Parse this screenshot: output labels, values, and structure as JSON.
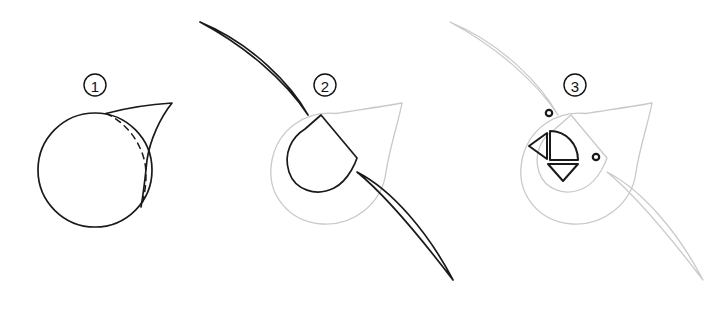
{
  "document": {
    "title": "Three-step shape construction tutorial",
    "width": 706,
    "height": 314,
    "background_color": "#ffffff",
    "kind": "line-art drawing instructions"
  },
  "palette": {
    "ink": "#1a1a1a",
    "guide_gray": "#c9c9c9",
    "background": "#ffffff",
    "label_ink": "#111111"
  },
  "stroke_widths": {
    "ink": 1.7,
    "guide": 1.3,
    "dashed": 1.5,
    "label_ring": 1.4
  },
  "steps": [
    {
      "id": "step-1",
      "number": "1",
      "label_position": {
        "x": 95,
        "y": 85
      },
      "label_radius": 11,
      "description": "Draw a circle, then add a pointed tail sweeping up to the right; a dashed arc marks the hidden part of the circle.",
      "elements": [
        {
          "name": "base-circle",
          "type": "circle",
          "center_x": 95,
          "center_y": 170,
          "radius": 57,
          "style": "ink"
        },
        {
          "name": "tail-point",
          "type": "point",
          "x": 172,
          "y": 103
        },
        {
          "name": "hidden-arc",
          "type": "dashed-arc",
          "style": "dashed"
        }
      ]
    },
    {
      "id": "step-2",
      "number": "2",
      "label_position": {
        "x": 325,
        "y": 85
      },
      "label_radius": 11,
      "description": "Keep the teardrop as a light guide, then add two long tapered wings and an inner rotated teardrop.",
      "elements": [
        {
          "name": "guide-teardrop",
          "type": "teardrop",
          "style": "guide"
        },
        {
          "name": "upper-wing",
          "type": "tapered-leaf",
          "tip_x": 200,
          "tip_y": 22,
          "style": "ink"
        },
        {
          "name": "lower-wing",
          "type": "tapered-leaf",
          "tip_x": 453,
          "tip_y": 280,
          "style": "ink"
        },
        {
          "name": "inner-teardrop",
          "type": "rotated-teardrop",
          "style": "ink"
        }
      ]
    },
    {
      "id": "step-3",
      "number": "3",
      "label_position": {
        "x": 575,
        "y": 85
      },
      "label_radius": 11,
      "description": "All prior lines become light guides; add two anchor dots plus a half-disc and two small triangles at the core.",
      "elements": [
        {
          "name": "guide-teardrop",
          "type": "teardrop",
          "style": "guide"
        },
        {
          "name": "guide-upper-wing",
          "type": "tapered-leaf",
          "style": "guide"
        },
        {
          "name": "guide-lower-wing",
          "type": "tapered-leaf",
          "style": "guide"
        },
        {
          "name": "guide-inner-teardrop",
          "type": "rotated-teardrop",
          "style": "guide"
        },
        {
          "name": "anchor-dot-top",
          "type": "ring-dot",
          "x": 549,
          "y": 113,
          "radius": 3
        },
        {
          "name": "anchor-dot-right",
          "type": "ring-dot",
          "x": 596,
          "y": 157,
          "radius": 3
        },
        {
          "name": "half-disc",
          "type": "half-disc",
          "style": "ink"
        },
        {
          "name": "left-triangle",
          "type": "triangle",
          "direction": "left",
          "style": "ink"
        },
        {
          "name": "down-triangle",
          "type": "triangle",
          "direction": "down",
          "style": "ink"
        }
      ]
    }
  ],
  "geometry": {
    "step1": {
      "circle": {
        "cx": 95,
        "cy": 170,
        "r": 57
      },
      "tail_path": "M 106 113.5 C 130 107 155 104 172 103 C 160 118 150 140 147 160 C 145 180 143 196 141 207",
      "dashed_arc_path": "M 106 113.5 C 125 122 140 140 145 163 C 147 176 146 192 141 207"
    },
    "step2": {
      "guide_teardrop_path": "M 336 113.5 C 305 110 278 130 272 160 C 265 195 290 222 322 224 C 353 226 382 204 386 172 C 390 146 398 124 402 103 C 385 106 358 110 336 113.5 Z",
      "upper_wing_path": "M 200 22 C 245 46 285 80 308 115 C 292 86 253 44 200 22 Z",
      "lower_wing_path": "M 357 172 C 392 190 428 232 453 280 C 424 242 389 198 357 172 Z",
      "inner_teardrop_path": "M 321 115 L 357 158 C 357 158 350 180 334 188 C 316 197 295 190 289 172 C 283 153 292 137 305 129 Z"
    },
    "step3": {
      "guide_teardrop_path": "M 586 113.5 C 555 110 528 130 522 160 C 515 195 540 222 572 224 C 603 226 632 204 636 172 C 640 146 648 124 652 103 C 635 106 608 110 586 113.5 Z",
      "guide_inner_teardrop_path": "M 571 115 L 607 158 C 607 158 600 180 584 188 C 566 197 545 190 539 172 C 533 153 542 137 555 129 Z",
      "guide_upper_wing_path": "M 450 22 C 495 46 535 80 558 115 C 542 86 503 44 450 22 Z",
      "guide_lower_wing_path": "M 607 172 C 642 190 678 232 703 280 C 674 242 639 198 607 172 Z",
      "half_disc_path": "M 550 131 L 578 160 L 550 160 Z",
      "half_disc_arc_path": "M 550 131 C 566 131 578 144 578 160 L 550 160 Z",
      "left_triangle_path": "M 547 133 L 547 159 L 529 146 Z",
      "down_triangle_path": "M 548 164 L 578 164 L 563 181 Z"
    }
  }
}
